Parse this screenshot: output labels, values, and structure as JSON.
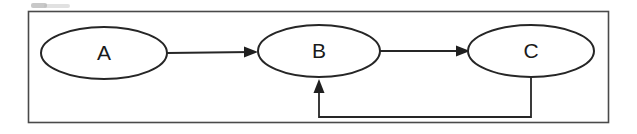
{
  "figure": {
    "background_color": "#ffffff",
    "stroke_color": "#262626",
    "frame_color": "#4a4a4a",
    "label_color": "#1a1a1a"
  },
  "frame": {
    "name": "outer-border",
    "x": 28,
    "y": 11,
    "width": 581,
    "height": 112
  },
  "nodes": [
    {
      "id": "A",
      "label": "A",
      "cx": 104,
      "cy": 53,
      "rx": 63,
      "ry": 26
    },
    {
      "id": "B",
      "label": "B",
      "cx": 319,
      "cy": 51,
      "rx": 61,
      "ry": 26
    },
    {
      "id": "C",
      "label": "C",
      "cx": 531,
      "cy": 51,
      "rx": 63,
      "ry": 26
    }
  ],
  "edges": [
    {
      "id": "a-to-b",
      "from": "A",
      "to": "B",
      "label": "",
      "kind": "straight",
      "direction": "right"
    },
    {
      "id": "b-to-c",
      "from": "B",
      "to": "C",
      "label": "",
      "kind": "straight",
      "direction": "right"
    },
    {
      "id": "c-to-b-feedback",
      "from": "C",
      "to": "B",
      "label": "",
      "kind": "orthogonal-feedback",
      "direction": "up"
    }
  ],
  "artifacts": {
    "top_left_smudge": "scan-smudge"
  }
}
